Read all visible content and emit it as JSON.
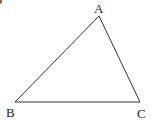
{
  "diagram": {
    "type": "triangle",
    "partial_label": "P",
    "vertices": [
      {
        "name": "A",
        "x": 99,
        "y": 16
      },
      {
        "name": "B",
        "x": 15,
        "y": 102
      },
      {
        "name": "C",
        "x": 140,
        "y": 102
      }
    ],
    "labels": {
      "a": "A",
      "b": "B",
      "c": "C"
    },
    "stroke_color": "#333333"
  }
}
